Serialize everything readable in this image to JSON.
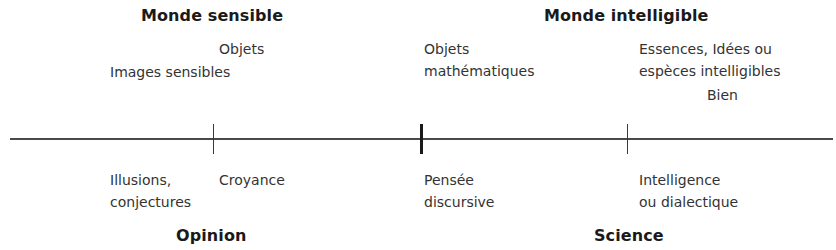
{
  "diagram": {
    "top_headings": {
      "left": "Monde sensible",
      "right": "Monde intelligible"
    },
    "bottom_headings": {
      "left": "Opinion",
      "right": "Science"
    },
    "objects_above": {
      "images": "Images sensibles",
      "objects": "Objets",
      "math_line1": "Objets",
      "math_line2": "mathématiques",
      "ideas_line1": "Essences, Idées ou",
      "ideas_line2": "espèces intelligibles",
      "good": "Bien"
    },
    "faculties_below": {
      "illusions_line1": "Illusions,",
      "illusions_line2": "conjectures",
      "belief": "Croyance",
      "thought_line1": "Pensée",
      "thought_line2": "discursive",
      "intelligence_line1": "Intelligence",
      "intelligence_line2": "ou dialectique"
    },
    "axis": {
      "ticks": [
        {
          "x": 213,
          "weight": "thin"
        },
        {
          "x": 421,
          "weight": "thick"
        },
        {
          "x": 627,
          "weight": "thin"
        }
      ]
    }
  }
}
